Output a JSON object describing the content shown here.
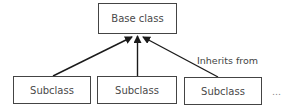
{
  "diagram": {
    "type": "inheritance-tree",
    "base": {
      "label": "Base class"
    },
    "subclasses": [
      {
        "label": "Subclass"
      },
      {
        "label": "Subclass"
      },
      {
        "label": "Subclass"
      }
    ],
    "edge_label": "Inherits from",
    "continuation": "...",
    "colors": {
      "line": "#1a1a1a",
      "box_border": "#444444",
      "text": "#4a4a4a"
    }
  }
}
